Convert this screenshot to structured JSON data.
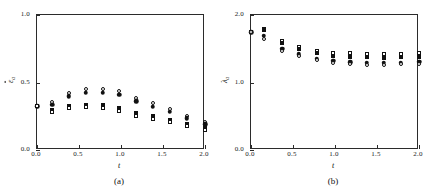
{
  "figure": {
    "panels": [
      {
        "id": "a",
        "caption": "(a)",
        "xlabel": "t",
        "ylabel_base": "ε",
        "ylabel_sub": "a",
        "xticks": [
          "0.0",
          "0.5",
          "1.0",
          "1.5",
          "2.0"
        ],
        "yticks": [
          "1.0",
          "0.5",
          "0.0"
        ]
      },
      {
        "id": "b",
        "caption": "(b)",
        "xlabel": "t",
        "ylabel_base": "λ",
        "ylabel_sub": "a",
        "xticks": [
          "0.0",
          "0.5",
          "1.0",
          "1.5",
          "2.0"
        ],
        "yticks": [
          "2.0",
          "1.0",
          "0.0"
        ]
      }
    ]
  },
  "chart_data": [
    {
      "type": "scatter",
      "panel": "a",
      "title": "(a)",
      "xlabel": "t",
      "ylabel": "ε̄_a",
      "xlim": [
        0.0,
        2.0
      ],
      "ylim": [
        0.0,
        1.0
      ],
      "xticks": [
        0.0,
        0.5,
        1.0,
        1.5,
        2.0
      ],
      "yticks": [
        0.0,
        0.5,
        1.0
      ],
      "grid": false,
      "legend": "none",
      "x": [
        0.0,
        0.18,
        0.38,
        0.58,
        0.78,
        0.98,
        1.18,
        1.38,
        1.58,
        1.78,
        2.0
      ],
      "series": [
        {
          "name": "open-circle",
          "marker": "circle-open",
          "values": [
            0.325,
            0.355,
            0.425,
            0.455,
            0.455,
            0.435,
            0.385,
            0.345,
            0.305,
            0.255,
            0.205
          ]
        },
        {
          "name": "filled-circle",
          "marker": "circle-filled",
          "values": [
            0.325,
            0.335,
            0.4,
            0.425,
            0.425,
            0.41,
            0.36,
            0.32,
            0.285,
            0.235,
            0.19
          ]
        },
        {
          "name": "filled-square",
          "marker": "square-filled",
          "values": [
            0.325,
            0.3,
            0.325,
            0.335,
            0.33,
            0.31,
            0.275,
            0.25,
            0.225,
            0.195,
            0.16
          ]
        },
        {
          "name": "open-square",
          "marker": "square-open",
          "values": [
            0.325,
            0.28,
            0.31,
            0.315,
            0.31,
            0.29,
            0.255,
            0.23,
            0.21,
            0.18,
            0.15
          ]
        }
      ]
    },
    {
      "type": "scatter",
      "panel": "b",
      "title": "(b)",
      "xlabel": "t",
      "ylabel": "λ_a",
      "xlim": [
        0.0,
        2.0
      ],
      "ylim": [
        0.0,
        2.0
      ],
      "xticks": [
        0.0,
        0.5,
        1.0,
        1.5,
        2.0
      ],
      "yticks": [
        0.0,
        1.0,
        2.0
      ],
      "grid": false,
      "legend": "none",
      "x": [
        0.0,
        0.15,
        0.37,
        0.57,
        0.78,
        0.98,
        1.18,
        1.38,
        1.58,
        1.78,
        2.0
      ],
      "series": [
        {
          "name": "open-square",
          "marker": "square-open",
          "values": [
            1.745,
            1.8,
            1.62,
            1.53,
            1.47,
            1.44,
            1.43,
            1.42,
            1.42,
            1.425,
            1.44
          ]
        },
        {
          "name": "filled-square",
          "marker": "square-filled",
          "values": [
            1.745,
            1.775,
            1.59,
            1.5,
            1.435,
            1.4,
            1.385,
            1.375,
            1.37,
            1.375,
            1.385
          ]
        },
        {
          "name": "filled-circle",
          "marker": "circle-filled",
          "values": [
            1.745,
            1.69,
            1.5,
            1.42,
            1.355,
            1.32,
            1.3,
            1.29,
            1.29,
            1.295,
            1.305
          ]
        },
        {
          "name": "open-circle",
          "marker": "circle-open",
          "values": [
            1.745,
            1.65,
            1.47,
            1.395,
            1.33,
            1.295,
            1.275,
            1.265,
            1.265,
            1.27,
            1.28
          ]
        }
      ]
    }
  ]
}
